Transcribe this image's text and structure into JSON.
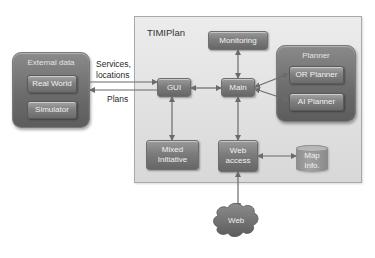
{
  "diagram": {
    "title": "TIMIPlan",
    "external_data": {
      "title": "External data",
      "items": [
        {
          "label": "Real World"
        },
        {
          "label": "Simulator"
        }
      ]
    },
    "edge_labels": {
      "services_locations_line1": "Services,",
      "services_locations_line2": "locations",
      "plans": "Plans"
    },
    "nodes": {
      "gui": "GUI",
      "main": "Main",
      "monitoring": "Monitoring",
      "mixed_initiative_line1": "Mixed",
      "mixed_initiative_line2": "Initiative",
      "web_access_line1": "Web",
      "web_access_line2": "access",
      "map_info_line1": "Map",
      "map_info_line2": "Info.",
      "web_cloud": "Web"
    },
    "planner": {
      "title": "Planner",
      "items": [
        {
          "label": "OR Planner"
        },
        {
          "label": "AI Planner"
        }
      ]
    },
    "edges": [
      {
        "from": "External data",
        "to": "GUI",
        "label": "Services, locations",
        "direction": "forward"
      },
      {
        "from": "GUI",
        "to": "External data",
        "label": "Plans",
        "direction": "forward"
      },
      {
        "from": "GUI",
        "to": "Main",
        "direction": "bidirectional"
      },
      {
        "from": "Main",
        "to": "Monitoring",
        "direction": "bidirectional"
      },
      {
        "from": "Main",
        "to": "OR Planner",
        "direction": "bidirectional"
      },
      {
        "from": "Main",
        "to": "AI Planner",
        "direction": "bidirectional"
      },
      {
        "from": "GUI",
        "to": "Mixed Initiative",
        "direction": "bidirectional"
      },
      {
        "from": "Main",
        "to": "Web access",
        "direction": "bidirectional"
      },
      {
        "from": "Web access",
        "to": "Map Info.",
        "direction": "bidirectional"
      },
      {
        "from": "Web access",
        "to": "Web",
        "direction": "bidirectional"
      }
    ],
    "colors": {
      "container_bg": "#e0e0e0",
      "node_fill": "#7c7c7c",
      "group_fill": "#6a6a6a",
      "arrow": "#6b6b6b",
      "text_light": "#f2f2f2",
      "text_dark": "#2a2a2a"
    }
  }
}
